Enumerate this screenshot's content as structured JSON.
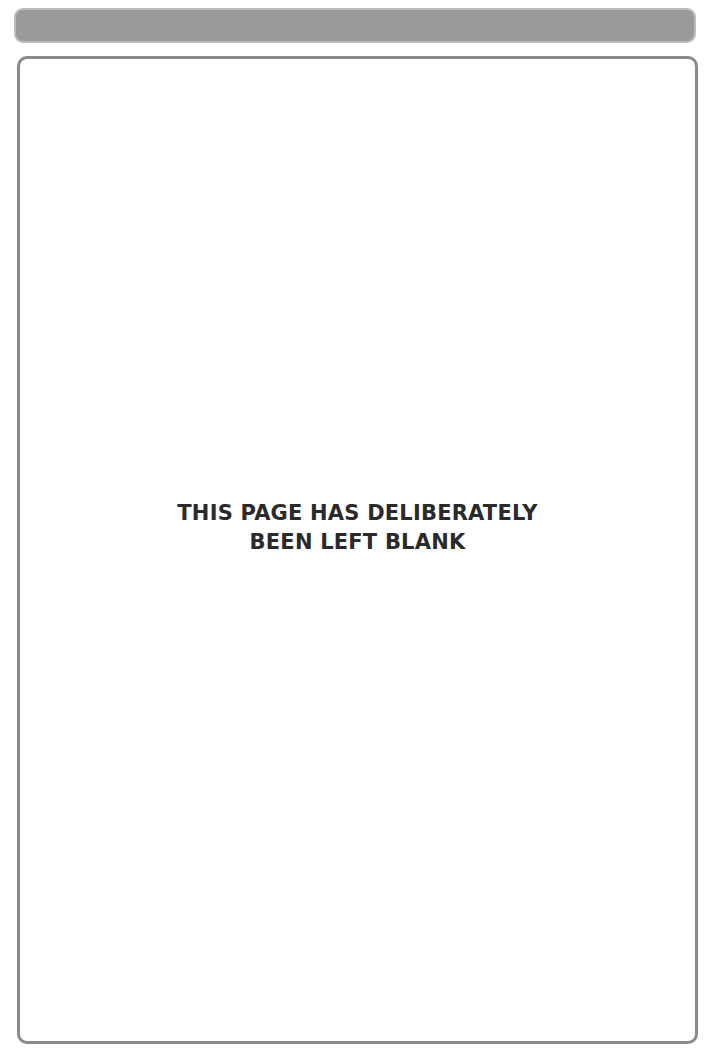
{
  "header": {
    "bar_color": "#9a9a9a"
  },
  "page": {
    "notice": {
      "line1": "THIS PAGE HAS DELIBERATELY",
      "line2": "BEEN LEFT BLANK"
    }
  }
}
